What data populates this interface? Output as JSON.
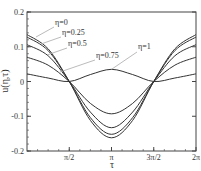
{
  "chart_data": {
    "type": "line",
    "title": "",
    "xlabel": "τ",
    "ylabel": "u(η,τ)",
    "xlim": [
      0,
      6.2832
    ],
    "ylim": [
      -0.2,
      0.2
    ],
    "grid": false,
    "legend_position": "inline annotations with leader lines",
    "x_ticks": [
      {
        "value": 1.5708,
        "label": "π/2"
      },
      {
        "value": 3.1416,
        "label": "π"
      },
      {
        "value": 4.7124,
        "label": "3π/2"
      },
      {
        "value": 6.2832,
        "label": "2π"
      }
    ],
    "y_ticks": [
      {
        "value": 0.2,
        "label": "0.2"
      },
      {
        "value": 0.1,
        "label": "0.1"
      },
      {
        "value": 0,
        "label": "0"
      },
      {
        "value": -0.1,
        "label": "-0.1"
      },
      {
        "value": -0.2,
        "label": "-0.2"
      }
    ],
    "x": [
      0,
      0.7854,
      1.5708,
      2.3562,
      3.1416,
      3.927,
      4.7124,
      5.4978,
      6.2832
    ],
    "series": [
      {
        "name": "η=0",
        "values": [
          0.135,
          0.094,
          0.0,
          -0.112,
          -0.162,
          -0.112,
          0.0,
          0.094,
          0.135
        ]
      },
      {
        "name": "η=0.25",
        "values": [
          0.128,
          0.089,
          0.0,
          -0.104,
          -0.152,
          -0.104,
          0.0,
          0.089,
          0.128
        ]
      },
      {
        "name": "η=0.5",
        "values": [
          0.106,
          0.074,
          0.0,
          -0.088,
          -0.133,
          -0.088,
          0.0,
          0.074,
          0.106
        ]
      },
      {
        "name": "η=0.75",
        "values": [
          0.07,
          0.047,
          0.0,
          -0.063,
          -0.093,
          -0.063,
          0.0,
          0.047,
          0.07
        ]
      },
      {
        "name": "η=1",
        "values": [
          0.022,
          0.01,
          0.0,
          0.02,
          0.035,
          0.02,
          0.0,
          0.01,
          0.022
        ]
      }
    ],
    "annotations": [
      {
        "text": "η=0",
        "target_series": "η=0"
      },
      {
        "text": "η=0.25",
        "target_series": "η=0.25"
      },
      {
        "text": "η=0.5",
        "target_series": "η=0.5"
      },
      {
        "text": "η=0.75",
        "target_series": "η=0.75"
      },
      {
        "text": "η=1",
        "target_series": "η=1"
      }
    ]
  },
  "colors": {
    "line": "#333333",
    "axis": "#444444",
    "leader": "#aaaaaa",
    "background": "#ffffff"
  }
}
